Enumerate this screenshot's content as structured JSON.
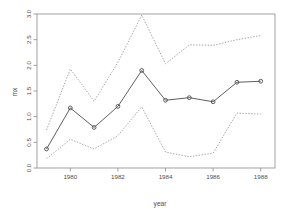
{
  "chart_data": {
    "type": "line",
    "title": "",
    "subtitle": "",
    "xlabel": "year",
    "ylabel": "mx",
    "xlim": [
      1978.6,
      1988.6
    ],
    "ylim": [
      0.0,
      3.0
    ],
    "xticks": [
      1980,
      1982,
      1984,
      1986,
      1988
    ],
    "xticklabels": [
      "1980",
      "1982",
      "1984",
      "1986",
      "1988"
    ],
    "yticks": [
      0.0,
      0.5,
      1.0,
      1.5,
      2.0,
      2.5,
      3.0
    ],
    "yticklabels": [
      "0.0",
      "0.5",
      "1.0",
      "1.5",
      "2.0",
      "2.5",
      "3.0"
    ],
    "grid": false,
    "legend": "none",
    "box": true,
    "x": [
      1979,
      1980,
      1981,
      1982,
      1983,
      1984,
      1985,
      1986,
      1987,
      1988
    ],
    "series": [
      {
        "name": "estimate",
        "style": "solid-with-circle-markers",
        "color": "#4d4d4d",
        "values": [
          0.37,
          1.17,
          0.79,
          1.2,
          1.9,
          1.32,
          1.37,
          1.29,
          1.67,
          1.69
        ]
      },
      {
        "name": "upper-confidence-band",
        "style": "dotted",
        "color": "#9a9a9a",
        "values": [
          0.74,
          1.93,
          1.3,
          2.06,
          2.98,
          2.03,
          2.4,
          2.39,
          2.5,
          2.58
        ]
      },
      {
        "name": "lower-confidence-band",
        "style": "dotted",
        "color": "#9a9a9a",
        "values": [
          0.18,
          0.56,
          0.37,
          0.63,
          1.19,
          0.31,
          0.22,
          0.29,
          1.07,
          1.05
        ]
      }
    ]
  },
  "axes": {
    "x_axis_title": "year",
    "y_axis_title": "mx"
  },
  "colors": {
    "line": "#4d4d4d",
    "band": "#9a9a9a",
    "box": "#8c8c8c",
    "text": "#4d4d4d",
    "background": "#ffffff"
  }
}
